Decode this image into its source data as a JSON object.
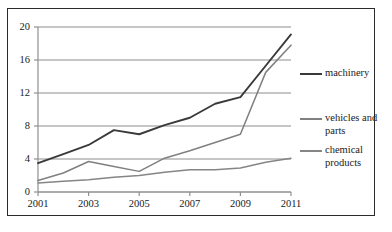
{
  "chart_data": {
    "type": "line",
    "title": "",
    "xlabel": "",
    "ylabel": "",
    "x": [
      2001,
      2002,
      2003,
      2004,
      2005,
      2006,
      2007,
      2008,
      2009,
      2010,
      2011
    ],
    "xlim": [
      2001,
      2011
    ],
    "ylim": [
      0,
      20
    ],
    "xticks": [
      2001,
      2003,
      2005,
      2007,
      2009,
      2011
    ],
    "xtick_labels": [
      "2001",
      "2003",
      "2005",
      "2007",
      "2009",
      "2011"
    ],
    "yticks": [
      0,
      4,
      8,
      12,
      16,
      20
    ],
    "ytick_labels": [
      "0",
      "4",
      "8",
      "12",
      "16",
      "20"
    ],
    "grid": "horizontal",
    "legend_position": "right",
    "series": [
      {
        "name": "machinery",
        "color": "#3a3a3a",
        "values": [
          3.5,
          4.6,
          5.7,
          7.5,
          7.0,
          8.1,
          9.0,
          10.7,
          11.5,
          15.3,
          19.1
        ]
      },
      {
        "name": "vehicles and parts",
        "color": "#808080",
        "values": [
          1.4,
          2.3,
          3.7,
          3.1,
          2.5,
          4.1,
          5.0,
          6.0,
          7.0,
          14.5,
          17.8
        ]
      },
      {
        "name": "chemical products",
        "color": "#858585",
        "values": [
          1.1,
          1.3,
          1.5,
          1.8,
          2.0,
          2.4,
          2.7,
          2.7,
          2.9,
          3.6,
          4.1
        ]
      }
    ]
  },
  "legend": {
    "entries": [
      {
        "label": "machinery"
      },
      {
        "label": "vehicles and parts"
      },
      {
        "label": "chemical products"
      }
    ]
  }
}
